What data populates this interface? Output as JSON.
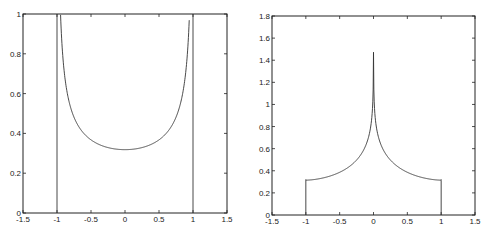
{
  "chart_data": [
    {
      "type": "line",
      "title": "",
      "xlabel": "",
      "ylabel": "",
      "xlim": [
        -1.5,
        1.5
      ],
      "ylim": [
        0,
        1
      ],
      "grid": false,
      "xticks": [
        "-1.5",
        "-1",
        "-0.5",
        "0",
        "0.5",
        "1",
        "1.5"
      ],
      "yticks": [
        "0",
        "0.2",
        "0.4",
        "0.6",
        "0.8",
        "1"
      ],
      "series": [
        {
          "name": "arcsine density 1/(pi*sqrt(1-x^2)), clipped at 1",
          "x": [
            -1.0,
            -0.95,
            -0.9,
            -0.8,
            -0.7,
            -0.6,
            -0.5,
            -0.4,
            -0.3,
            -0.2,
            -0.1,
            0,
            0.1,
            0.2,
            0.3,
            0.4,
            0.5,
            0.6,
            0.7,
            0.8,
            0.9,
            0.95,
            1.0
          ],
          "y": [
            1.0,
            1.0,
            0.73,
            0.53,
            0.446,
            0.398,
            0.368,
            0.347,
            0.334,
            0.325,
            0.32,
            0.318,
            0.32,
            0.325,
            0.334,
            0.347,
            0.368,
            0.398,
            0.446,
            0.53,
            0.73,
            1.0,
            1.0
          ],
          "notes": "vertical lines at x=-1 and x=1 from 0 to 1"
        }
      ]
    },
    {
      "type": "line",
      "title": "",
      "xlabel": "",
      "ylabel": "",
      "xlim": [
        -1.5,
        1.5
      ],
      "ylim": [
        0,
        1.8
      ],
      "grid": false,
      "xticks": [
        "-1.5",
        "-1",
        "-0.5",
        "0",
        "0.5",
        "1",
        "1.5"
      ],
      "yticks": [
        "0",
        "0.2",
        "0.4",
        "0.6",
        "0.8",
        "1",
        "1.2",
        "1.4",
        "1.6",
        "1.8"
      ],
      "series": [
        {
          "name": "cusp density",
          "x": [
            -1.0,
            -1.0,
            -0.8,
            -0.6,
            -0.4,
            -0.3,
            -0.2,
            -0.1,
            -0.05,
            -0.02,
            0,
            0.02,
            0.05,
            0.1,
            0.2,
            0.3,
            0.4,
            0.6,
            0.8,
            1.0,
            1.0
          ],
          "y": [
            0,
            0.32,
            0.36,
            0.41,
            0.48,
            0.53,
            0.61,
            0.76,
            0.92,
            1.15,
            1.67,
            1.15,
            0.92,
            0.76,
            0.61,
            0.53,
            0.48,
            0.41,
            0.36,
            0.31,
            0
          ]
        }
      ]
    }
  ],
  "left_plot": {
    "xticks": [
      "-1.5",
      "-1",
      "-0.5",
      "0",
      "0.5",
      "1",
      "1.5"
    ],
    "yticks": [
      "0",
      "0.2",
      "0.4",
      "0.6",
      "0.8",
      "1"
    ]
  },
  "right_plot": {
    "xticks": [
      "-1.5",
      "-1",
      "-0.5",
      "0",
      "0.5",
      "1",
      "1.5"
    ],
    "yticks": [
      "0",
      "0.2",
      "0.4",
      "0.6",
      "0.8",
      "1",
      "1.2",
      "1.4",
      "1.6",
      "1.8"
    ]
  },
  "colors": {
    "line": "#333333",
    "axes": "#222222",
    "background": "#ffffff"
  }
}
